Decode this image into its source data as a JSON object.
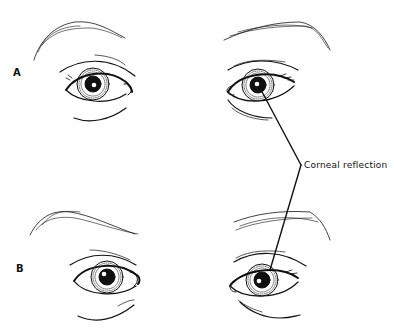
{
  "figure": {
    "panels": [
      {
        "label": "A",
        "description": "Both eyes with corneal reflections"
      },
      {
        "label": "B",
        "description": "Both eyes with corneal reflections"
      }
    ],
    "annotation": {
      "text": "Corneal reflection"
    }
  },
  "colors": {
    "ink": "#111111",
    "background": "#ffffff"
  }
}
